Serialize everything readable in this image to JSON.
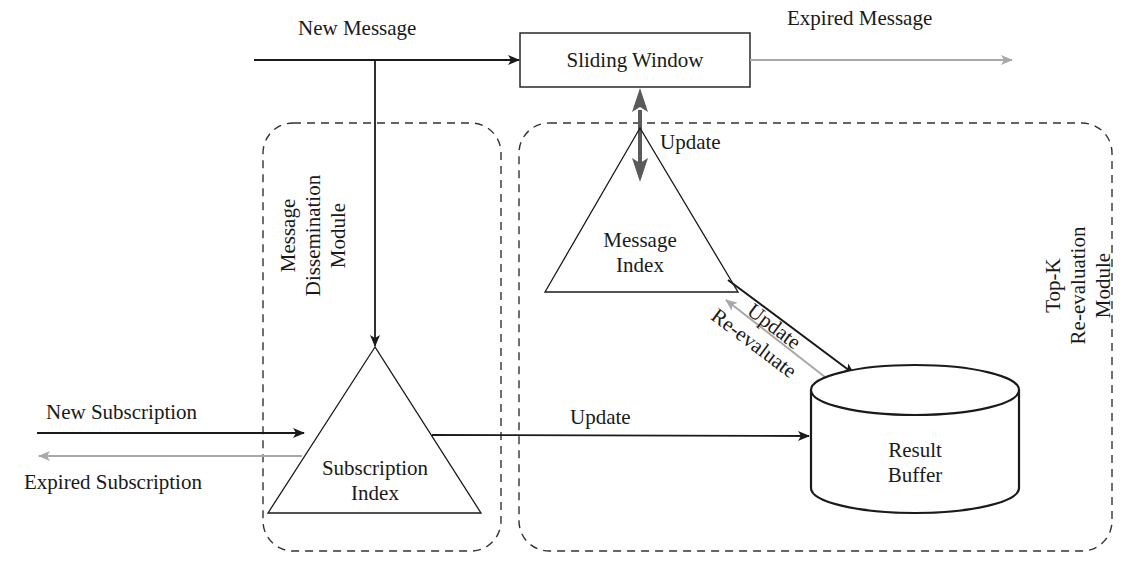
{
  "diagram": {
    "modules": {
      "dissemination": {
        "line1": "Message",
        "line2": "Dissemination",
        "line3": "Module"
      },
      "reevaluation": {
        "line1": "Top-K",
        "line2": "Re-evaluation",
        "line3": "Module"
      }
    },
    "nodes": {
      "sliding_window": "Sliding Window",
      "message_index": {
        "line1": "Message",
        "line2": "Index"
      },
      "subscription_index": {
        "line1": "Subscription",
        "line2": "Index"
      },
      "result_buffer": {
        "line1": "Result",
        "line2": "Buffer"
      }
    },
    "edges": {
      "new_message": "New Message",
      "expired_message": "Expired Message",
      "window_update": "Update",
      "index_update": "Update",
      "reevaluate": "Re-evaluate",
      "subscription_update": "Update",
      "new_subscription": "New Subscription",
      "expired_subscription": "Expired Subscription"
    },
    "colors": {
      "ink": "#1a1a1a",
      "gray_arrow": "#a8a8a8",
      "dark_gray_arrow": "#5a5a5a",
      "dash": "#333333"
    }
  }
}
